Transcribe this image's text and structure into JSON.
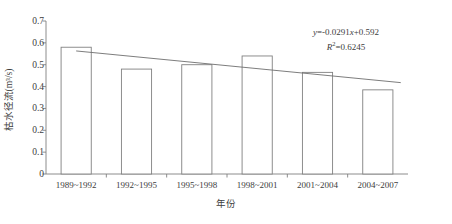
{
  "chart_data": {
    "type": "bar",
    "title": "",
    "xlabel": "年份",
    "ylabel": "枯水径流(m³/s)",
    "categories": [
      "1989~1992",
      "1992~1995",
      "1995~1998",
      "1998~2001",
      "2001~2004",
      "2004~2007"
    ],
    "values": [
      0.58,
      0.48,
      0.5,
      0.54,
      0.465,
      0.385
    ],
    "series": [
      {
        "name": "枯水径流",
        "values": [
          0.58,
          0.48,
          0.5,
          0.54,
          0.465,
          0.385
        ]
      }
    ],
    "ylim": [
      0,
      0.7
    ],
    "ytick_labels": [
      "0",
      "0.1",
      "0.2",
      "0.3",
      "0.4",
      "0.5",
      "0.6",
      "0.7"
    ],
    "ytick_values": [
      0,
      0.1,
      0.2,
      0.3,
      0.4,
      0.5,
      0.6,
      0.7
    ],
    "grid": false,
    "legend": "none",
    "trendline": {
      "type": "linear",
      "equation": "y=-0.0291x+0.592",
      "equation_y": "y",
      "equation_body": "=-0.0291",
      "equation_x": "x",
      "equation_tail": "+0.592",
      "r_squared_label": "R",
      "r_squared_exp": "2",
      "r_squared_value": "=0.6245",
      "slope": -0.0291,
      "intercept": 0.592,
      "r_squared": 0.6245,
      "start_value": 0.563,
      "end_value": 0.418
    },
    "annotation_lines": [
      "y=-0.0291x+0.592",
      "R2=0.6245"
    ],
    "bar_style": {
      "fill": "#ffffff",
      "stroke": "#808080",
      "stroke_width": 0.9
    },
    "axis_color": "#808080",
    "trendline_color": "#6e6e6e",
    "background": "#ffffff"
  }
}
